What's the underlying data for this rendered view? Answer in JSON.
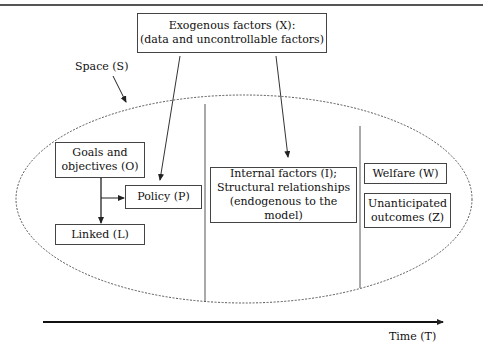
{
  "diagram": {
    "exogenous": {
      "line1": "Exogenous factors (X):",
      "line2": "(data and uncontrollable factors)"
    },
    "space_label": "Space (S)",
    "goals": {
      "line1": "Goals and",
      "line2": "objectives (O)"
    },
    "policy": "Policy (P)",
    "linked": "Linked (L)",
    "internal": {
      "line1": "Internal factors (I);",
      "line2": "Structural relationships",
      "line3": "(endogenous to the model)"
    },
    "welfare": "Welfare (W)",
    "unanticipated": {
      "line1": "Unanticipated",
      "line2": "outcomes (Z)"
    },
    "time_label": "Time (T)"
  }
}
